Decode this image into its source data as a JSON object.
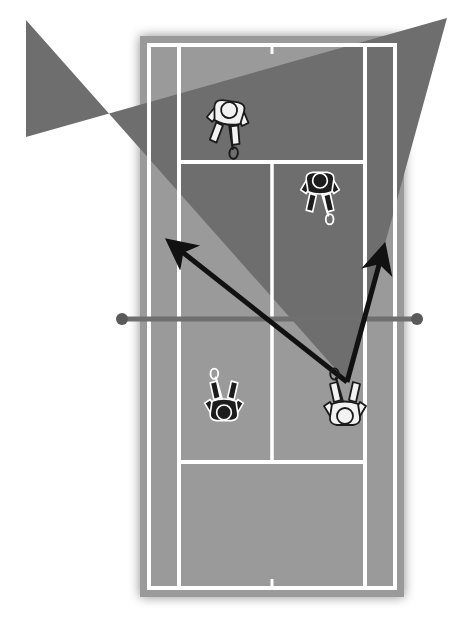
{
  "diagram": {
    "sport": "tennis",
    "view": "overhead",
    "format": "doubles"
  },
  "canvas": {
    "width": 467,
    "height": 636,
    "background_color": "#ffffff"
  },
  "court": {
    "surface_near_color": "#9a9a9a",
    "surface_far_color": "#6e6e6e",
    "line_color": "#ffffff",
    "line_width": 4,
    "outer_left_x": 149,
    "outer_right_x": 395,
    "top_baseline_y": 45,
    "bottom_baseline_y": 588,
    "singles_left_x": 179,
    "singles_right_x": 365,
    "service_line_top_y": 162,
    "service_line_bottom_y": 462,
    "center_service_line_x": 272,
    "net_y": 319,
    "center_mark_top": {
      "x": 272,
      "y_from": 45,
      "y_to": 54
    },
    "center_mark_bottom": {
      "x": 272,
      "y_from": 579,
      "y_to": 588
    }
  },
  "net": {
    "label": "net",
    "color": "#6f6f6f",
    "y": 319,
    "left_post_x": 122,
    "right_post_x": 417,
    "post_radius": 6,
    "post_color": "#5a5a5a",
    "line_width": 5
  },
  "shaded_zone": {
    "label": "covered-return-zone",
    "color": "#6e6e6e",
    "opacity": 1,
    "description": "dark wedge spreading from the shot origin across the far court and beyond the sidelines",
    "points": "347,382 26,20 26,137 447,18"
  },
  "trajectory": {
    "label": "shot-trajectory-v",
    "color": "#111111",
    "line_width": 5,
    "origin": {
      "x": 347,
      "y": 382
    },
    "segments": [
      {
        "name": "left-shot",
        "from": {
          "x": 347,
          "y": 382
        },
        "to": {
          "x": 157,
          "y": 232
        },
        "arrowhead": true
      },
      {
        "name": "right-shot",
        "from": {
          "x": 347,
          "y": 382
        },
        "to": {
          "x": 388,
          "y": 232
        },
        "arrowhead": true
      }
    ]
  },
  "players": [
    {
      "id": "player-far-deuce",
      "team": "white",
      "team_color": "#f2f2f2",
      "outline_color": "#1a1a1a",
      "x": 228,
      "y": 118,
      "rotation": 8,
      "scale": 1.0,
      "facing": "down",
      "racket": "down-right",
      "zone": "far-left-service-box"
    },
    {
      "id": "player-far-ad",
      "team": "dark",
      "team_color": "#1c1c1c",
      "outline_color": "#ffffff",
      "x": 320,
      "y": 188,
      "rotation": 0,
      "scale": 0.92,
      "facing": "down",
      "racket": "down",
      "zone": "far-right-service-box"
    },
    {
      "id": "player-near-left",
      "team": "dark",
      "team_color": "#1c1c1c",
      "outline_color": "#ffffff",
      "x": 224,
      "y": 405,
      "rotation": 180,
      "scale": 0.92,
      "facing": "up",
      "racket": "up",
      "zone": "near-left-service-box"
    },
    {
      "id": "player-near-right",
      "team": "white",
      "team_color": "#f2f2f2",
      "outline_color": "#1a1a1a",
      "x": 345,
      "y": 408,
      "rotation": 180,
      "scale": 1.0,
      "facing": "up",
      "racket": "up",
      "zone": "near-right-service-box"
    }
  ]
}
